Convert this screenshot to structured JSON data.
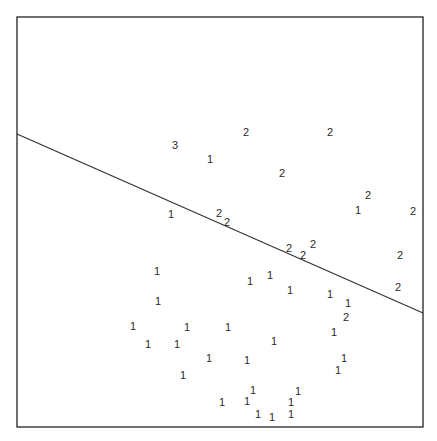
{
  "chart_data": {
    "type": "scatter",
    "title": "",
    "xlabel": "",
    "ylabel": "",
    "grid": false,
    "legend": null,
    "frame": {
      "left": 17,
      "top": 17,
      "right": 423,
      "bottom": 427
    },
    "decision_line": {
      "x1": 17,
      "y1": 134,
      "x2": 423,
      "y2": 313
    },
    "note": "Points are plotted as class-label glyphs; coordinates are pixel positions within the 437x441 figure.",
    "series": [
      {
        "name": "3",
        "points": [
          [
            175,
            145
          ]
        ]
      },
      {
        "name": "2",
        "points": [
          [
            246,
            132
          ],
          [
            330,
            132
          ],
          [
            282,
            173
          ],
          [
            368,
            195
          ],
          [
            413,
            211
          ],
          [
            219,
            213
          ],
          [
            227,
            222
          ],
          [
            289,
            248
          ],
          [
            303,
            255
          ],
          [
            313,
            244
          ],
          [
            400,
            255
          ],
          [
            398,
            287
          ],
          [
            346,
            317
          ]
        ]
      },
      {
        "name": "1",
        "points": [
          [
            210,
            159
          ],
          [
            358,
            210
          ],
          [
            171,
            214
          ],
          [
            157,
            271
          ],
          [
            158,
            301
          ],
          [
            250,
            281
          ],
          [
            270,
            275
          ],
          [
            290,
            290
          ],
          [
            330,
            294
          ],
          [
            348,
            303
          ],
          [
            133,
            326
          ],
          [
            187,
            327
          ],
          [
            228,
            327
          ],
          [
            334,
            332
          ],
          [
            148,
            344
          ],
          [
            177,
            344
          ],
          [
            274,
            341
          ],
          [
            209,
            358
          ],
          [
            247,
            360
          ],
          [
            344,
            358
          ],
          [
            338,
            370
          ],
          [
            183,
            375
          ],
          [
            222,
            402
          ],
          [
            247,
            401
          ],
          [
            253,
            390
          ],
          [
            291,
            402
          ],
          [
            298,
            391
          ],
          [
            258,
            414
          ],
          [
            272,
            417
          ],
          [
            291,
            414
          ]
        ]
      }
    ]
  },
  "colors": {
    "ink": "#2a2a2a",
    "background": "#ffffff"
  }
}
